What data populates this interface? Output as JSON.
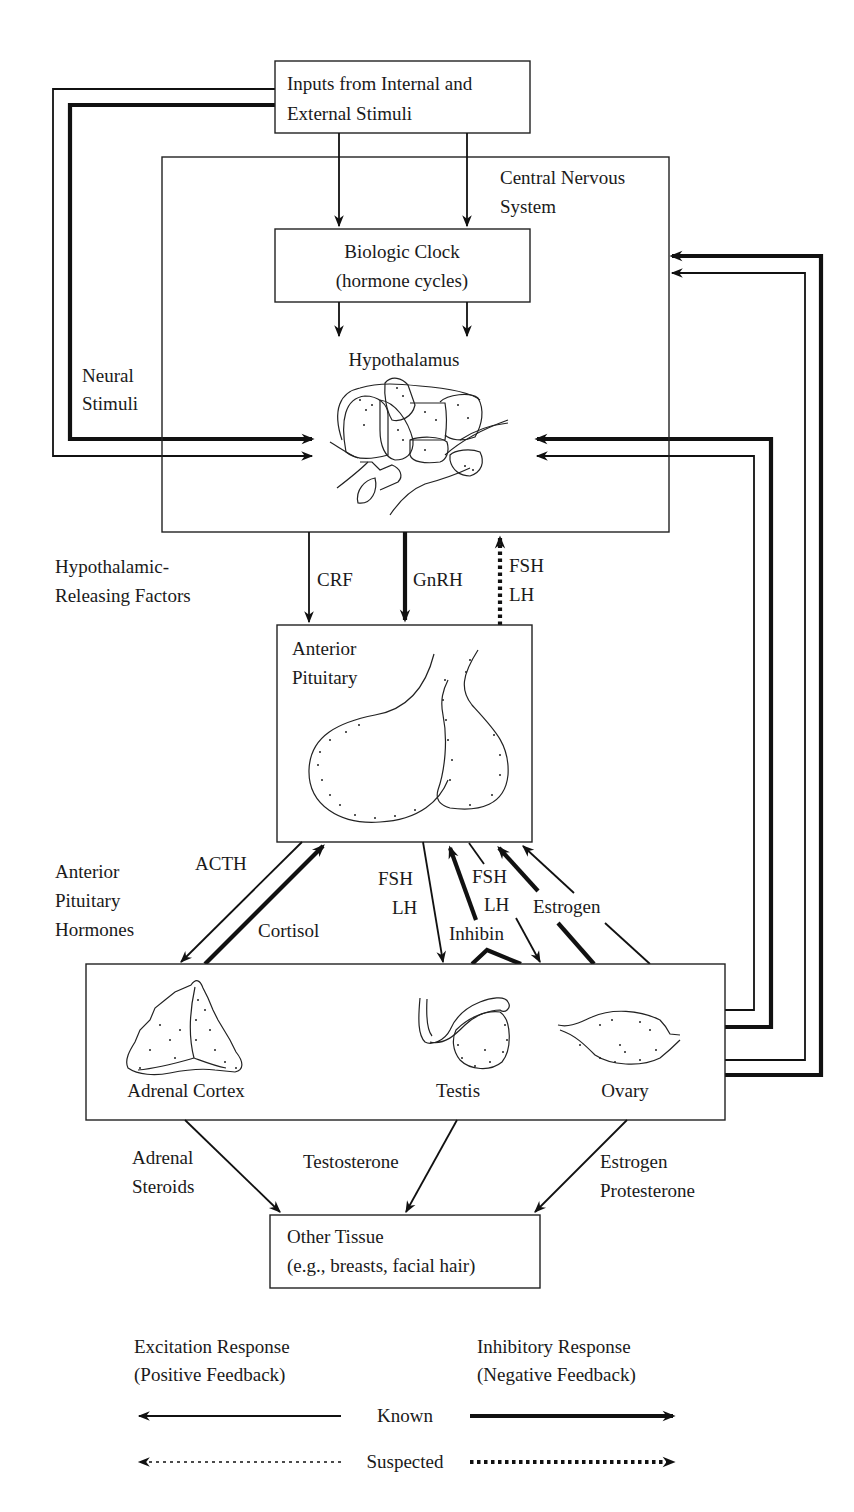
{
  "nodes": {
    "inputs": {
      "line1": "Inputs from Internal and",
      "line2": "External Stimuli"
    },
    "cns": {
      "line1": "Central Nervous",
      "line2": "System"
    },
    "clock": {
      "line1": "Biologic Clock",
      "line2": "(hormone cycles)"
    },
    "hypothalamus": {
      "label": "Hypothalamus"
    },
    "pituitary": {
      "line1": "Anterior",
      "line2": "Pituitary"
    },
    "glands": {
      "adrenal": "Adrenal Cortex",
      "testis": "Testis",
      "ovary": "Ovary"
    },
    "other_tissue": {
      "line1": "Other Tissue",
      "line2": "(e.g., breasts, facial hair)"
    }
  },
  "side_labels": {
    "neural_stimuli": {
      "line1": "Neural",
      "line2": "Stimuli"
    },
    "releasing_factors": {
      "line1": "Hypothalamic-",
      "line2": "Releasing Factors"
    },
    "pituitary_hormones": {
      "line1": "Anterior",
      "line2": "Pituitary",
      "line3": "Hormones"
    }
  },
  "arrow_labels": {
    "crf": "CRF",
    "gnrh": "GnRH",
    "fsh_lh_up": {
      "line1": "FSH",
      "line2": "LH"
    },
    "acth": "ACTH",
    "cortisol": "Cortisol",
    "fsh_lh_testis": {
      "line1": "FSH",
      "line2": "LH"
    },
    "fsh_lh_ovary": {
      "line1": "FSH",
      "line2": "LH"
    },
    "inhibin": "Inhibin",
    "estrogen_feedback": "Estrogen",
    "adrenal_steroids": {
      "line1": "Adrenal",
      "line2": "Steroids"
    },
    "testosterone": "Testosterone",
    "estrogen_progesterone": {
      "line1": "Estrogen",
      "line2": "Protesterone"
    }
  },
  "legend": {
    "excitation": {
      "line1": "Excitation Response",
      "line2": "(Positive Feedback)"
    },
    "inhibitory": {
      "line1": "Inhibitory Response",
      "line2": "(Negative Feedback)"
    },
    "known": "Known",
    "suspected": "Suspected"
  }
}
